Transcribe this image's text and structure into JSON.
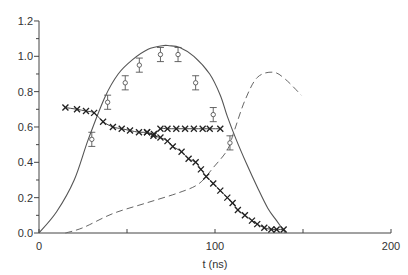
{
  "chart_data": {
    "type": "line",
    "title": "",
    "xlabel": "t (ns)",
    "ylabel": "",
    "xlim": [
      0,
      200
    ],
    "ylim": [
      0,
      1.2
    ],
    "x_ticks": [
      "0",
      "100",
      "200"
    ],
    "x_minor_ticks": [
      50,
      150
    ],
    "y_ticks": [
      "0.0",
      "0.2",
      "0.4",
      "0.6",
      "0.8",
      "1.0",
      "1.2"
    ],
    "grid": false,
    "legend": null,
    "series": [
      {
        "name": "solid-curve",
        "style": "solid line",
        "x": [
          0,
          10,
          20,
          28,
          37.5,
          45,
          53,
          62,
          70,
          74,
          80,
          88,
          97,
          103,
          107,
          112,
          118,
          124,
          130,
          135,
          140
        ],
        "y": [
          0,
          0.12,
          0.3,
          0.53,
          0.77,
          0.9,
          0.98,
          1.04,
          1.06,
          1.06,
          1.05,
          1.0,
          0.9,
          0.78,
          0.66,
          0.53,
          0.39,
          0.26,
          0.14,
          0.07,
          0.0
        ]
      },
      {
        "name": "dashed-curve",
        "style": "dashed line",
        "x": [
          15,
          25,
          42,
          61,
          80,
          91,
          99,
          107,
          111,
          117,
          124,
          133,
          140,
          149
        ],
        "y": [
          0.0,
          0.03,
          0.11,
          0.17,
          0.23,
          0.28,
          0.37,
          0.47,
          0.58,
          0.75,
          0.88,
          0.91,
          0.87,
          0.78
        ]
      },
      {
        "name": "circle-points-with-error-bars",
        "style": "open circles with error bars",
        "x": [
          30,
          39,
          49,
          57,
          69,
          79,
          89,
          99,
          108.5
        ],
        "y": [
          0.53,
          0.74,
          0.85,
          0.95,
          1.01,
          1.01,
          0.85,
          0.67,
          0.51
        ],
        "error": [
          0.04,
          0.04,
          0.04,
          0.04,
          0.04,
          0.04,
          0.04,
          0.04,
          0.04
        ]
      },
      {
        "name": "cross-points-upper",
        "style": "x markers with line",
        "x": [
          15,
          21.6,
          26.7,
          31.3,
          36.4,
          42,
          47,
          51.7,
          56.8,
          61.4,
          65.3,
          69,
          73,
          78,
          83,
          88,
          93,
          97,
          103
        ],
        "y": [
          0.71,
          0.7,
          0.69,
          0.68,
          0.63,
          0.6,
          0.59,
          0.58,
          0.57,
          0.57,
          0.56,
          0.59,
          0.59,
          0.59,
          0.59,
          0.59,
          0.59,
          0.59,
          0.59
        ]
      },
      {
        "name": "cross-points-decay",
        "style": "x markers with line",
        "x": [
          61.4,
          65,
          69,
          73,
          76,
          81,
          85,
          89,
          92,
          95,
          99,
          103,
          107,
          110,
          113,
          117,
          121,
          124,
          128,
          132,
          135,
          139
        ],
        "y": [
          0.57,
          0.55,
          0.54,
          0.52,
          0.49,
          0.46,
          0.42,
          0.4,
          0.36,
          0.32,
          0.28,
          0.24,
          0.2,
          0.17,
          0.13,
          0.1,
          0.07,
          0.05,
          0.03,
          0.02,
          0.02,
          0.02
        ]
      }
    ]
  },
  "axes": {
    "xlabel": "t (ns)",
    "x_tick_labels": [
      "0",
      "100",
      "200"
    ],
    "y_tick_labels": [
      "0.0",
      "0.2",
      "0.4",
      "0.6",
      "0.8",
      "1.0",
      "1.2"
    ]
  }
}
